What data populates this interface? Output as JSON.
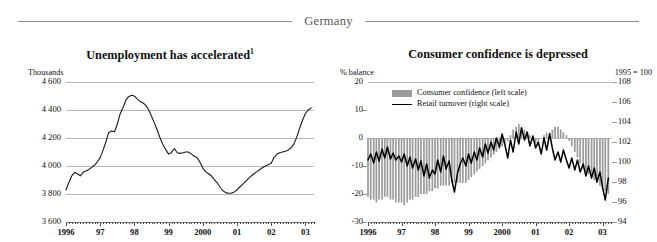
{
  "header": {
    "title": "Germany"
  },
  "panels": {
    "left": {
      "title": "Unemployment has accelerated",
      "title_footnote": "1",
      "unit_label": "Thousands",
      "y_ticks": [
        "4 600",
        "4 400",
        "4 200",
        "4 000",
        "3 800",
        "3 600"
      ],
      "x_labels": [
        "1996",
        "97",
        "98",
        "99",
        "2000",
        "01",
        "02",
        "03"
      ]
    },
    "right": {
      "title": "Consumer confidence is depressed",
      "unit_label_left": "% balance",
      "unit_label_right": "1995 = 100",
      "y_ticks_left": [
        "20",
        "10",
        "0",
        "-10",
        "-20",
        "-30"
      ],
      "y_ticks_right": [
        "108",
        "106",
        "104",
        "102",
        "100",
        "98",
        "96",
        "94"
      ],
      "x_labels": [
        "1996",
        "97",
        "98",
        "99",
        "2000",
        "01",
        "02",
        "03"
      ],
      "legend": [
        {
          "label": "Consumer confidence (left scale)",
          "marker": "bar-swatch",
          "color": "#9c9c9c"
        },
        {
          "label": "Retail turnover (right scale)",
          "marker": "line-swatch",
          "color": "#000000"
        }
      ]
    }
  },
  "colors": {
    "rule": "#8d8d8d",
    "gridline": "#b8b8b8",
    "bar_fill": "#9c9c9c",
    "line": "#1a1a1a",
    "text": "#111111",
    "header_text": "#555555"
  },
  "chart_data": [
    {
      "type": "line",
      "id": "unemployment",
      "title": "Unemployment has accelerated",
      "xlabel": "",
      "ylabel": "Thousands",
      "ylim": [
        3600,
        4600
      ],
      "yticks": [
        3600,
        3800,
        4000,
        4200,
        4400,
        4600
      ],
      "xlim": [
        1996.0,
        2003.25
      ],
      "xticks": [
        1996,
        1997,
        1998,
        1999,
        2000,
        2001,
        2002,
        2003
      ],
      "grid": true,
      "legend": "none",
      "series": [
        {
          "name": "Unemployment (thousands)",
          "x": [
            1996.0,
            1996.08,
            1996.17,
            1996.25,
            1996.33,
            1996.42,
            1996.5,
            1996.58,
            1996.67,
            1996.75,
            1996.83,
            1996.92,
            1997.0,
            1997.08,
            1997.17,
            1997.25,
            1997.33,
            1997.42,
            1997.5,
            1997.58,
            1997.67,
            1997.75,
            1997.83,
            1997.92,
            1998.0,
            1998.08,
            1998.17,
            1998.25,
            1998.33,
            1998.42,
            1998.5,
            1998.58,
            1998.67,
            1998.75,
            1998.83,
            1998.92,
            1999.0,
            1999.08,
            1999.17,
            1999.25,
            1999.33,
            1999.42,
            1999.5,
            1999.58,
            1999.67,
            1999.75,
            1999.83,
            1999.92,
            2000.0,
            2000.08,
            2000.17,
            2000.25,
            2000.33,
            2000.42,
            2000.5,
            2000.58,
            2000.67,
            2000.75,
            2000.83,
            2000.92,
            2001.0,
            2001.08,
            2001.17,
            2001.25,
            2001.33,
            2001.42,
            2001.5,
            2001.58,
            2001.67,
            2001.75,
            2001.83,
            2001.92,
            2002.0,
            2002.08,
            2002.17,
            2002.25,
            2002.33,
            2002.42,
            2002.5,
            2002.58,
            2002.67,
            2002.75,
            2002.83,
            2002.92,
            2003.0,
            2003.08,
            2003.17
          ],
          "y": [
            3830,
            3880,
            3930,
            3955,
            3945,
            3930,
            3955,
            3965,
            3975,
            3990,
            4005,
            4030,
            4060,
            4110,
            4175,
            4240,
            4250,
            4245,
            4300,
            4370,
            4420,
            4470,
            4495,
            4505,
            4500,
            4480,
            4460,
            4450,
            4435,
            4400,
            4355,
            4310,
            4255,
            4200,
            4155,
            4115,
            4085,
            4095,
            4125,
            4095,
            4090,
            4095,
            4100,
            4100,
            4085,
            4070,
            4060,
            4025,
            3985,
            3960,
            3945,
            3930,
            3905,
            3880,
            3850,
            3825,
            3810,
            3805,
            3805,
            3815,
            3830,
            3850,
            3870,
            3890,
            3910,
            3930,
            3945,
            3960,
            3975,
            3990,
            4000,
            4010,
            4020,
            4060,
            4085,
            4095,
            4100,
            4105,
            4115,
            4130,
            4160,
            4210,
            4270,
            4330,
            4375,
            4400,
            4415
          ]
        }
      ]
    },
    {
      "type": "bar+line",
      "id": "consumer-confidence",
      "title": "Consumer confidence is depressed",
      "xlabel": "",
      "ylabel_left": "% balance",
      "ylabel_right": "1995 = 100",
      "ylim_left": [
        -30,
        20
      ],
      "yticks_left": [
        -30,
        -20,
        -10,
        0,
        10,
        20
      ],
      "ylim_right": [
        94,
        108
      ],
      "yticks_right": [
        94,
        96,
        98,
        100,
        102,
        104,
        106,
        108
      ],
      "xlim": [
        1996.0,
        2003.25
      ],
      "xticks": [
        1996,
        1997,
        1998,
        1999,
        2000,
        2001,
        2002,
        2003
      ],
      "grid": true,
      "legend_position": "top-left",
      "series": [
        {
          "name": "Consumer confidence (left scale)",
          "type": "bar",
          "axis": "left",
          "color": "#9c9c9c",
          "x": [
            1996.0,
            1996.08,
            1996.17,
            1996.25,
            1996.33,
            1996.42,
            1996.5,
            1996.58,
            1996.67,
            1996.75,
            1996.83,
            1996.92,
            1997.0,
            1997.08,
            1997.17,
            1997.25,
            1997.33,
            1997.42,
            1997.5,
            1997.58,
            1997.67,
            1997.75,
            1997.83,
            1997.92,
            1998.0,
            1998.08,
            1998.17,
            1998.25,
            1998.33,
            1998.42,
            1998.5,
            1998.58,
            1998.67,
            1998.75,
            1998.83,
            1998.92,
            1999.0,
            1999.08,
            1999.17,
            1999.25,
            1999.33,
            1999.42,
            1999.5,
            1999.58,
            1999.67,
            1999.75,
            1999.83,
            1999.92,
            2000.0,
            2000.08,
            2000.17,
            2000.25,
            2000.33,
            2000.42,
            2000.5,
            2000.58,
            2000.67,
            2000.75,
            2000.83,
            2000.92,
            2001.0,
            2001.08,
            2001.17,
            2001.25,
            2001.33,
            2001.42,
            2001.5,
            2001.58,
            2001.67,
            2001.75,
            2001.83,
            2001.92,
            2002.0,
            2002.08,
            2002.17,
            2002.25,
            2002.33,
            2002.42,
            2002.5,
            2002.58,
            2002.67,
            2002.75,
            2002.83,
            2002.92,
            2003.0,
            2003.08,
            2003.17
          ],
          "y": [
            -21,
            -22,
            -22,
            -23,
            -22,
            -22,
            -21,
            -21,
            -22,
            -22,
            -23,
            -23,
            -23,
            -24,
            -23,
            -22,
            -22,
            -21,
            -21,
            -20,
            -20,
            -20,
            -19,
            -19,
            -18,
            -18,
            -17,
            -17,
            -17,
            -17,
            -16,
            -16,
            -16,
            -16,
            -16,
            -16,
            -15,
            -14,
            -13,
            -12,
            -11,
            -10,
            -9,
            -8,
            -7,
            -6,
            -5,
            -4,
            -3,
            -2,
            -1,
            1,
            3,
            4,
            5,
            4,
            3,
            2,
            1,
            -1,
            -2,
            -1,
            0,
            1,
            2,
            2,
            3,
            4,
            4,
            3,
            2,
            1,
            -1,
            -3,
            -5,
            -7,
            -9,
            -11,
            -12,
            -13,
            -14,
            -15,
            -16,
            -17,
            -18,
            -19,
            -20
          ]
        },
        {
          "name": "Retail turnover (right scale)",
          "type": "line",
          "axis": "right",
          "color": "#000000",
          "x": [
            1996.0,
            1996.08,
            1996.17,
            1996.25,
            1996.33,
            1996.42,
            1996.5,
            1996.58,
            1996.67,
            1996.75,
            1996.83,
            1996.92,
            1997.0,
            1997.08,
            1997.17,
            1997.25,
            1997.33,
            1997.42,
            1997.5,
            1997.58,
            1997.67,
            1997.75,
            1997.83,
            1997.92,
            1998.0,
            1998.08,
            1998.17,
            1998.25,
            1998.33,
            1998.42,
            1998.5,
            1998.58,
            1998.67,
            1998.75,
            1998.83,
            1998.92,
            1999.0,
            1999.08,
            1999.17,
            1999.25,
            1999.33,
            1999.42,
            1999.5,
            1999.58,
            1999.67,
            1999.75,
            1999.83,
            1999.92,
            2000.0,
            2000.08,
            2000.17,
            2000.25,
            2000.33,
            2000.42,
            2000.5,
            2000.58,
            2000.67,
            2000.75,
            2000.83,
            2000.92,
            2001.0,
            2001.08,
            2001.17,
            2001.25,
            2001.33,
            2001.42,
            2001.5,
            2001.58,
            2001.67,
            2001.75,
            2001.83,
            2001.92,
            2002.0,
            2002.08,
            2002.17,
            2002.25,
            2002.33,
            2002.42,
            2002.5,
            2002.58,
            2002.67,
            2002.75,
            2002.83,
            2002.92,
            2003.0,
            2003.08,
            2003.17
          ],
          "y": [
            100.2,
            100.8,
            99.9,
            101.0,
            100.1,
            101.3,
            100.4,
            101.5,
            100.3,
            100.9,
            100.2,
            100.6,
            100.0,
            100.8,
            99.6,
            100.5,
            99.4,
            100.3,
            99.2,
            100.1,
            98.6,
            99.8,
            98.4,
            99.2,
            98.8,
            100.2,
            99.0,
            100.6,
            99.3,
            100.1,
            98.2,
            97.0,
            98.9,
            99.8,
            100.4,
            99.6,
            100.8,
            99.9,
            101.0,
            100.2,
            101.4,
            100.5,
            101.8,
            100.9,
            102.0,
            101.2,
            102.4,
            101.5,
            102.8,
            101.8,
            100.4,
            102.2,
            101.0,
            103.0,
            101.8,
            103.4,
            102.2,
            103.0,
            101.6,
            102.6,
            101.4,
            102.0,
            100.8,
            102.4,
            101.2,
            102.8,
            101.4,
            100.2,
            101.0,
            100.0,
            101.2,
            100.2,
            99.4,
            100.4,
            99.2,
            100.2,
            99.0,
            99.8,
            98.6,
            99.6,
            98.4,
            99.4,
            98.0,
            99.0,
            97.4,
            96.2,
            98.4
          ]
        }
      ]
    }
  ]
}
